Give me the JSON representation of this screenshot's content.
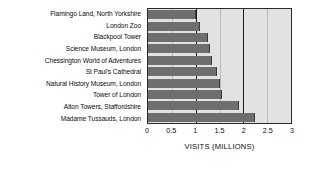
{
  "chart_data": {
    "type": "bar",
    "orientation": "horizontal",
    "title": "",
    "xlabel": "VISITS (MILLIONS)",
    "ylabel": "",
    "xlim": [
      0,
      3
    ],
    "xticks": [
      "0",
      "0.5",
      "1",
      "1.5",
      "2",
      "2.5",
      "3"
    ],
    "xtick_values": [
      0,
      0.5,
      1,
      1.5,
      2,
      2.5,
      3
    ],
    "grid": true,
    "legend": null,
    "categories": [
      "Flamingo Land, North Yorkshire",
      "London Zoo",
      "Blackpool Tower",
      "Science Museum, London",
      "Chessington World of Adventures",
      "St Paul's Cathedral",
      "Natural History Museum, London",
      "Tower of London",
      "Alton Towers, Staffordshire",
      "Madame Tussauds, London"
    ],
    "values": [
      1.0,
      1.1,
      1.25,
      1.3,
      1.35,
      1.45,
      1.5,
      1.55,
      1.9,
      2.25
    ],
    "bar_color": "#6e6e6e",
    "plot_background": "#e2e2e2",
    "grid_color": "#1c1c1c"
  }
}
